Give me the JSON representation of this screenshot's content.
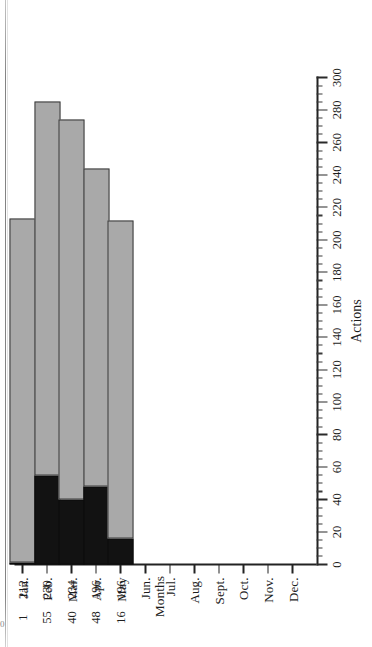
{
  "chart_data": {
    "type": "bar",
    "orientation": "horizontal-stacked",
    "title": "",
    "xlabel": "Months",
    "ylabel": "Actions",
    "ylim": [
      0,
      300
    ],
    "ytick_step": 20,
    "minor_ticks": true,
    "grid": false,
    "legend_position": "bottom-right",
    "categories": [
      "Jan.",
      "Feb.",
      "Mar.",
      "Apr.",
      "May",
      "Jun.",
      "Jul.",
      "Aug.",
      "Sept.",
      "Oct.",
      "Nov.",
      "Dec."
    ],
    "ticklabels_value": [
      "0",
      "20",
      "40",
      "60",
      "80",
      "100",
      "120",
      "140",
      "160",
      "180",
      "200",
      "220",
      "240",
      "260",
      "280",
      "300"
    ],
    "series": [
      {
        "name": "Zystrokes",
        "color": "#121212",
        "values": [
          1,
          55,
          40,
          48,
          16,
          null,
          null,
          null,
          null,
          null,
          null,
          null
        ]
      },
      {
        "name": "War Fuzzies",
        "color": "#a9a9a9",
        "values": [
          212,
          230,
          234,
          196,
          196,
          null,
          null,
          null,
          null,
          null,
          null,
          null
        ]
      }
    ],
    "data_table": {
      "row_labels": [
        "Fuzzies",
        "Zystrokes"
      ],
      "columns": [
        "Jan.",
        "Feb.",
        "Mar.",
        "Apr.",
        "May"
      ],
      "rows": [
        [
          "212",
          "230",
          "234",
          "196",
          "196"
        ],
        [
          "1",
          "55",
          "40",
          "48",
          "16"
        ]
      ]
    }
  },
  "axes": {
    "value_axis_title": "Actions",
    "category_axis_title": "Months",
    "value_ticks": [
      "0",
      "20",
      "40",
      "60",
      "80",
      "100",
      "120",
      "140",
      "160",
      "180",
      "200",
      "220",
      "240",
      "260",
      "280",
      "300"
    ],
    "category_ticks": [
      "Jan.",
      "Feb.",
      "Mar.",
      "Apr.",
      "May",
      "Jun.",
      "Jul.",
      "Aug.",
      "Sept.",
      "Oct.",
      "Nov.",
      "Dec."
    ]
  },
  "legend": {
    "items": [
      {
        "label": "Zystrokes",
        "color": "#121212"
      },
      {
        "label": "War Fuzzies",
        "color": "#a9a9a9"
      }
    ]
  },
  "data_table": {
    "row_label_fuzzies": "Fuzzies",
    "row_label_zystrokes": "Zystrokes",
    "fuzzies": [
      "212",
      "230",
      "234",
      "196",
      "196"
    ],
    "zystrokes": [
      "1",
      "55",
      "40",
      "48",
      "16"
    ]
  },
  "artifacts": {
    "corner_glyph": "0"
  }
}
